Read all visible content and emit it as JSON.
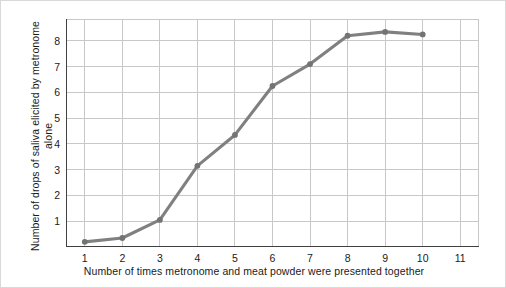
{
  "chart_data": {
    "type": "line",
    "title": "",
    "subtitle": "",
    "xlabel": "Number of times metronome and meat powder were presented together",
    "ylabel": "Number of drops of saliva elicited by metronome alone",
    "x": [
      1,
      2,
      3,
      4,
      5,
      6,
      7,
      8,
      9,
      10
    ],
    "values": [
      0.2,
      0.35,
      1.05,
      3.15,
      4.35,
      6.25,
      7.1,
      8.2,
      8.35,
      8.25
    ],
    "series": [
      {
        "name": "Saliva drops to metronome alone",
        "values": [
          0.2,
          0.35,
          1.05,
          3.15,
          4.35,
          6.25,
          7.1,
          8.2,
          8.35,
          8.25
        ]
      }
    ],
    "xlim": [
      0.5,
      11.5
    ],
    "ylim": [
      0,
      8.85
    ],
    "xticks": [
      1,
      2,
      3,
      4,
      5,
      6,
      7,
      8,
      9,
      10,
      11
    ],
    "xtick_labels": [
      "1",
      "2",
      "3",
      "4",
      "5",
      "6",
      "7",
      "8",
      "9",
      "10",
      "11"
    ],
    "yticks": [
      1,
      2,
      3,
      4,
      5,
      6,
      7,
      8
    ],
    "ytick_labels": [
      "1",
      "2",
      "3",
      "4",
      "5",
      "6",
      "7",
      "8"
    ],
    "grid": true,
    "grid_axes": "both",
    "legend": false,
    "legend_position": "none",
    "marker": "circle",
    "line_color": "#808080",
    "marker_color": "#737373",
    "grid_color": "#c8c8c8",
    "axis_color": "#404040",
    "background_color": "#ffffff",
    "annotations": []
  }
}
